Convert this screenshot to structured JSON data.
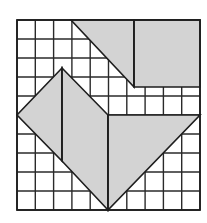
{
  "diagram": {
    "type": "tangram-style shaded shapes on square grid",
    "grid": {
      "columns": 10,
      "rows": 10,
      "x_lines": [
        17,
        35.3,
        53.6,
        71.9,
        90.2,
        108.5,
        126.8,
        145.1,
        163.4,
        181.7,
        200
      ],
      "y_lines": [
        20,
        39,
        58,
        77,
        96,
        115,
        134,
        153,
        172,
        191,
        210
      ]
    },
    "colors": {
      "background": "#ffffff",
      "grid_line": "#2a2a2a",
      "shape_fill": "#d3d3d3",
      "shape_stroke": "#1e1e1e"
    },
    "shapes": [
      {
        "name": "top-triangle",
        "points": "71,20 134,20 134,87"
      },
      {
        "name": "top-right-square",
        "points": "134,20 200,20 200,87 134,87"
      },
      {
        "name": "left-small-triangle",
        "points": "62,68 17,115 62,161"
      },
      {
        "name": "middle-parallelogram",
        "points": "62,68 108,115 108,210 62,161"
      },
      {
        "name": "right-triangle",
        "points": "108,115 200,115 108,210"
      }
    ],
    "dividers": [
      {
        "name": "top-divider",
        "x1": 134,
        "y1": 20,
        "x2": 134,
        "y2": 87
      },
      {
        "name": "left-divider",
        "x1": 62,
        "y1": 68,
        "x2": 62,
        "y2": 161
      },
      {
        "name": "center-divider",
        "x1": 108,
        "y1": 115,
        "x2": 108,
        "y2": 210
      }
    ]
  }
}
